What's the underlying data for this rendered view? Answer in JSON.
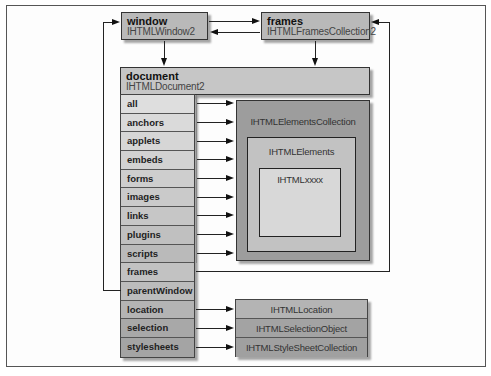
{
  "window": {
    "title": "window",
    "interface": "IHTMLWindow2",
    "color": "#b9b9b9"
  },
  "frames": {
    "title": "frames",
    "interface": "IHTMLFramesCollection2",
    "color": "#b9b9b9"
  },
  "document": {
    "title": "document",
    "interface": "IHTMLDocument2",
    "color": "#c6c6c6",
    "properties": [
      {
        "label": "all",
        "color": "#dedede"
      },
      {
        "label": "anchors",
        "color": "#dadada"
      },
      {
        "label": "applets",
        "color": "#d6d6d6"
      },
      {
        "label": "embeds",
        "color": "#d2d2d2"
      },
      {
        "label": "forms",
        "color": "#cecece"
      },
      {
        "label": "images",
        "color": "#cacaca"
      },
      {
        "label": "links",
        "color": "#c6c6c6"
      },
      {
        "label": "plugins",
        "color": "#c0c0c0"
      },
      {
        "label": "scripts",
        "color": "#bababa"
      },
      {
        "label": "frames",
        "color": "#c2c2c2"
      },
      {
        "label": "parentWindow",
        "color": "#bcbcbc"
      },
      {
        "label": "location",
        "color": "#b4b4b4"
      },
      {
        "label": "selection",
        "color": "#a8a8a8"
      },
      {
        "label": "stylesheets",
        "color": "#a4a4a4"
      }
    ]
  },
  "collection": {
    "outer": {
      "label": "IHTMLElementsCollection",
      "color": "#9d9d9d"
    },
    "middle": {
      "label": "IHTMLElements",
      "color": "#c2c2c2"
    },
    "inner": {
      "label": "IHTMLxxxx",
      "color": "#d8d8d8"
    }
  },
  "bottom_boxes": [
    {
      "label": "IHTMLLocation",
      "color": "#b4b4b4"
    },
    {
      "label": "IHTMLSelectionObject",
      "color": "#a3a3a3"
    },
    {
      "label": "IHTMLStyleSheetCollection",
      "color": "#a0a0a0"
    }
  ]
}
